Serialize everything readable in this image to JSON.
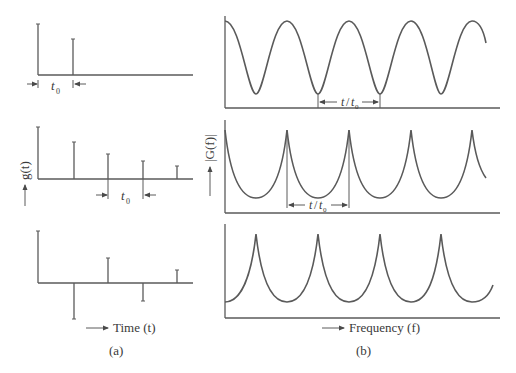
{
  "figure": {
    "panel_a": {
      "caption": "(a)",
      "y_label": "g(t)",
      "x_label": "Time (t)",
      "spacing_label_base": "t",
      "spacing_label_sub": "0",
      "rows": [
        {
          "name": "two-impulses",
          "impulses": [
            1.0,
            0.7
          ]
        },
        {
          "name": "decaying-impulse-train",
          "impulses": [
            1.0,
            0.71,
            0.48,
            0.35,
            0.25
          ]
        },
        {
          "name": "alternating-impulse-train",
          "impulses": [
            1.0,
            -0.69,
            0.48,
            -0.35,
            0.25
          ]
        }
      ]
    },
    "panel_b": {
      "caption": "(b)",
      "y_label": "|G(f)|",
      "x_label": "Frequency (f)",
      "period_label_num": "t",
      "period_label_den": "t",
      "period_label_sub": "0",
      "rows": [
        {
          "name": "cosine-spectrum",
          "shape": "raised-cosine",
          "peaks_at_origin": true
        },
        {
          "name": "peaked-spectrum-origin",
          "shape": "cusp-peaks",
          "peaks_at_origin": true
        },
        {
          "name": "peaked-spectrum-shifted",
          "shape": "cusp-peaks",
          "peaks_at_origin": false
        }
      ]
    }
  },
  "colors": {
    "ink": "#5a5a5a",
    "text": "#3a3a3a",
    "background": "#ffffff"
  }
}
